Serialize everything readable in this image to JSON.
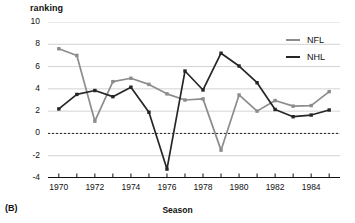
{
  "figure": {
    "panel_label": "(B)",
    "y_axis_title": "ranking",
    "x_axis_title": "Season"
  },
  "legend": {
    "position": "top-right",
    "entries": [
      {
        "label": "NFL",
        "color": "#8c8c8c"
      },
      {
        "label": "NHL",
        "color": "#262626"
      }
    ]
  },
  "axes": {
    "y_ticks": [
      "10",
      "8",
      "6",
      "4",
      "2",
      "0",
      "-2",
      "-4"
    ],
    "x_ticks": [
      "1970",
      "1972",
      "1974",
      "1976",
      "1978",
      "1980",
      "1982",
      "1984"
    ]
  },
  "chart_data": {
    "type": "line",
    "title": "",
    "subtitle": "",
    "xlabel": "Season",
    "ylabel": "ranking",
    "xlim": [
      1969.4,
      1985.6
    ],
    "ylim": [
      -4,
      10
    ],
    "y_ticks": [
      10,
      8,
      6,
      4,
      2,
      0,
      -2,
      -4
    ],
    "x_ticks_labeled": [
      1970,
      1972,
      1974,
      1976,
      1978,
      1980,
      1982,
      1984
    ],
    "x_tick_step_minor": 1,
    "grid": "horizontal",
    "zero_reference_line": {
      "value": 0,
      "style": "dashed"
    },
    "legend_position": "top-right",
    "marker": "square",
    "x": [
      1970,
      1971,
      1972,
      1973,
      1974,
      1975,
      1976,
      1977,
      1978,
      1979,
      1980,
      1981,
      1982,
      1983,
      1984,
      1985
    ],
    "series": [
      {
        "name": "NFL",
        "color": "#8c8c8c",
        "values": [
          7.6,
          7.0,
          1.1,
          4.65,
          4.95,
          4.4,
          3.55,
          3.0,
          3.1,
          -1.5,
          3.45,
          2.0,
          2.95,
          2.45,
          2.5,
          3.75
        ]
      },
      {
        "name": "NHL",
        "color": "#262626",
        "values": [
          2.2,
          3.5,
          3.85,
          3.3,
          4.15,
          1.9,
          -3.2,
          5.6,
          3.9,
          7.2,
          6.05,
          4.55,
          2.15,
          1.5,
          1.65,
          2.1
        ]
      }
    ]
  }
}
